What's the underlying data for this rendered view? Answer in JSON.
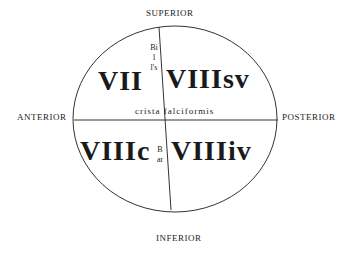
{
  "orientation": {
    "superior": "SUPERIOR",
    "inferior": "INFERIOR",
    "anterior": "ANTERIOR",
    "posterior": "POSTERIOR"
  },
  "quadrants": {
    "top_left": "VII",
    "top_right": "VIIIsv",
    "bottom_left": "VIIIc",
    "bottom_right": "VIIIiv"
  },
  "landmarks": {
    "horizontal": "crista falciformis",
    "vertical_upper": "Bill's",
    "vertical_lower": "Bar"
  }
}
